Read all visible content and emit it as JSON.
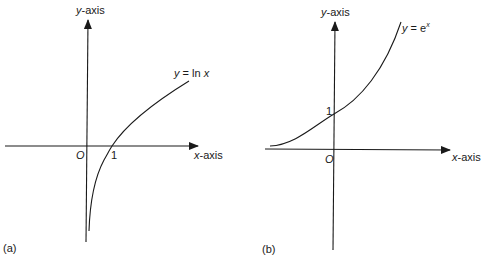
{
  "panels": [
    {
      "id": "a",
      "caption": "(a)",
      "y_axis_label": {
        "var": "y",
        "suffix": "-axis"
      },
      "x_axis_label": {
        "var": "x",
        "suffix": "-axis"
      },
      "origin_label": "O",
      "tick_label": "1",
      "curve_label": {
        "lhs": "y",
        "eq": " = ln ",
        "arg": "x"
      }
    },
    {
      "id": "b",
      "caption": "(b)",
      "y_axis_label": {
        "var": "y",
        "suffix": "-axis"
      },
      "x_axis_label": {
        "var": "x",
        "suffix": "-axis"
      },
      "origin_label": "O",
      "tick_label": "1",
      "curve_label": {
        "lhs": "y",
        "eq": " = e",
        "sup": "x"
      }
    }
  ],
  "colors": {
    "ink": "#1a1a1a",
    "background": "#ffffff"
  }
}
